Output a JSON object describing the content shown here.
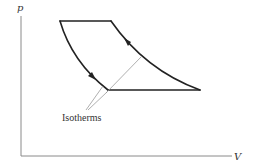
{
  "diagram": {
    "type": "pV-diagram",
    "axes": {
      "y_label": "p",
      "x_label": "V"
    },
    "annotation": {
      "label": "Isotherms"
    },
    "cycle": {
      "segments": [
        {
          "name": "top-isobar",
          "from": "top-left",
          "to": "top-right"
        },
        {
          "name": "left-curve",
          "from": "top-left",
          "to": "bottom-left",
          "direction": "down"
        },
        {
          "name": "bottom-isobar",
          "from": "bottom-left",
          "to": "bottom-right"
        },
        {
          "name": "right-curve",
          "from": "bottom-right",
          "to": "top-right",
          "direction": "up"
        }
      ]
    },
    "colors": {
      "cycle": "#222222",
      "axis": "#8a8a8a",
      "isotherm": "#9a9a9a",
      "text": "#333333"
    }
  }
}
